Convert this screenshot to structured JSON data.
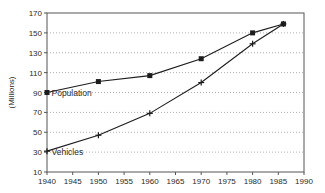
{
  "chart_data": {
    "type": "line",
    "title": "",
    "xlabel": "",
    "ylabel": "(Millions)",
    "xlim": [
      1940,
      1990
    ],
    "ylim": [
      10,
      170
    ],
    "x_ticks": [
      1940,
      1945,
      1950,
      1955,
      1960,
      1965,
      1970,
      1975,
      1980,
      1985,
      1990
    ],
    "y_ticks": [
      10,
      30,
      50,
      70,
      90,
      110,
      130,
      150,
      170
    ],
    "grid": "horizontal dotted gridlines, boxed plot area, no vertical gridlines",
    "legend_position": "inline labels beside first data point of each series",
    "series": [
      {
        "name": "Population",
        "marker": "filled-square",
        "x": [
          1940,
          1950,
          1960,
          1970,
          1980,
          1986
        ],
        "values": [
          90,
          101,
          107,
          124,
          150,
          159
        ]
      },
      {
        "name": "Vehicles",
        "marker": "plus",
        "x": [
          1940,
          1950,
          1960,
          1970,
          1980,
          1986
        ],
        "values": [
          31,
          47,
          69,
          100,
          139,
          159
        ]
      }
    ],
    "colors": {
      "line": "#1c1c1c",
      "marker": "#1c1c1c",
      "grid": "#9a9a9a",
      "axis": "#555555",
      "text": "#2a2a2a",
      "background": "#ffffff"
    }
  }
}
